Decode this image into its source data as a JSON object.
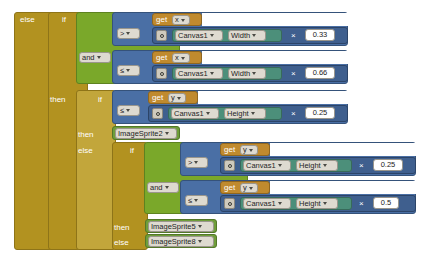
{
  "app": {
    "name": "MIT App Inventor Blocks Editor",
    "view": "blocks-canvas"
  },
  "palette": {
    "control_color": "#b29220",
    "control_light_color": "#c2a63b",
    "logic_color": "#7aa82a",
    "math_color": "#4a6fa5",
    "math_dark_color": "#3f5f8e",
    "variable_color": "#c08a2e",
    "component_color": "#4c8f7a",
    "sprite_color": "#6f9e3a",
    "field_color": "#dedad0",
    "number_field_color": "#ffffff",
    "canvas_background": "#ffffff"
  },
  "labels": {
    "else": "else",
    "if": "if",
    "then": "then",
    "get": "get",
    "and": "and",
    "times": "×",
    "caret": "▾"
  },
  "outer_block": {
    "else_label": "else",
    "if_label": "if",
    "then_label": "then"
  },
  "conditions": {
    "cond1": {
      "operator": ">",
      "left": {
        "kind": "variable-getter",
        "get": "get",
        "name": "x"
      },
      "right": {
        "kind": "multiply",
        "component": "Canvas1",
        "property": "Width",
        "operator": "×",
        "value": "0.33"
      }
    },
    "logic_op": "and",
    "cond2": {
      "operator": "≤",
      "left": {
        "kind": "variable-getter",
        "get": "get",
        "name": "x"
      },
      "right": {
        "kind": "multiply",
        "component": "Canvas1",
        "property": "Width",
        "operator": "×",
        "value": "0.66"
      }
    },
    "cond3": {
      "operator": "≤",
      "left": {
        "kind": "variable-getter",
        "get": "get",
        "name": "y"
      },
      "right": {
        "kind": "multiply",
        "component": "Canvas1",
        "property": "Height",
        "operator": "×",
        "value": "0.25"
      }
    },
    "cond4": {
      "operator": ">",
      "left": {
        "kind": "variable-getter",
        "get": "get",
        "name": "y"
      },
      "right": {
        "kind": "multiply",
        "component": "Canvas1",
        "property": "Height",
        "operator": "×",
        "value": "0.25"
      }
    },
    "logic_op2": "and",
    "cond5": {
      "operator": "≤",
      "left": {
        "kind": "variable-getter",
        "get": "get",
        "name": "y"
      },
      "right": {
        "kind": "multiply",
        "component": "Canvas1",
        "property": "Height",
        "operator": "×",
        "value": "0.5"
      }
    }
  },
  "results": {
    "then_inner_1": "ImageSprite2",
    "then_inner_2": "ImageSprite5",
    "else_inner_2": "ImageSprite8"
  },
  "inner_block": {
    "then_label": "then",
    "else_label": "else",
    "if_label": "if"
  },
  "inner_block_2": {
    "if_label": "if",
    "then_label": "then",
    "else_label": "else"
  }
}
